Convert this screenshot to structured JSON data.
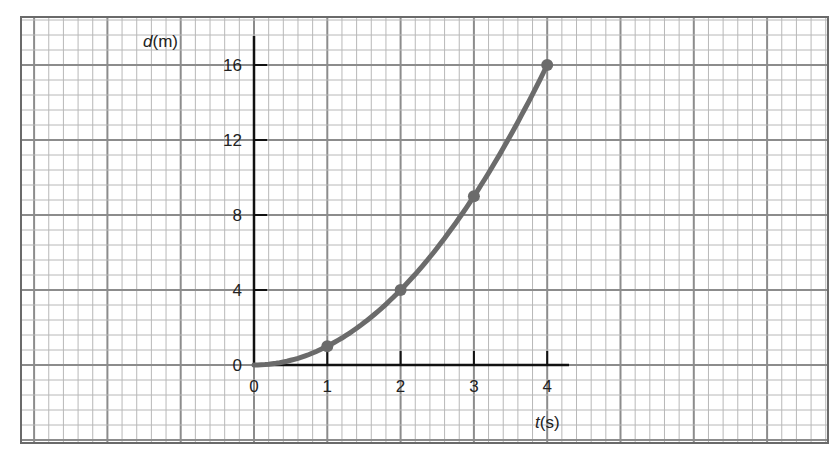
{
  "chart_data": {
    "type": "line",
    "title": "",
    "xlabel": "t(s)",
    "xlabel_var": "t",
    "xlabel_unit": "(s)",
    "ylabel": "d(m)",
    "ylabel_var": "d",
    "ylabel_unit": "(m)",
    "x_ticks": [
      0,
      1,
      2,
      3,
      4
    ],
    "y_ticks": [
      0,
      4,
      8,
      12,
      16
    ],
    "xlim": [
      0,
      4.3
    ],
    "ylim": [
      0,
      17.5
    ],
    "grid": true,
    "legend": null,
    "series": [
      {
        "name": "d vs t",
        "x": [
          0,
          1,
          2,
          3,
          4
        ],
        "y": [
          0,
          1,
          4,
          9,
          16
        ],
        "markers_at": [
          1,
          2,
          3,
          4
        ],
        "curve": "d = t^2",
        "color": "#6b6b6b"
      }
    ]
  },
  "style": {
    "grid_minor_color": "#b8b8b8",
    "grid_major_color": "#8c8c8c",
    "axis_color": "#111111",
    "curve_color": "#6b6b6b"
  }
}
